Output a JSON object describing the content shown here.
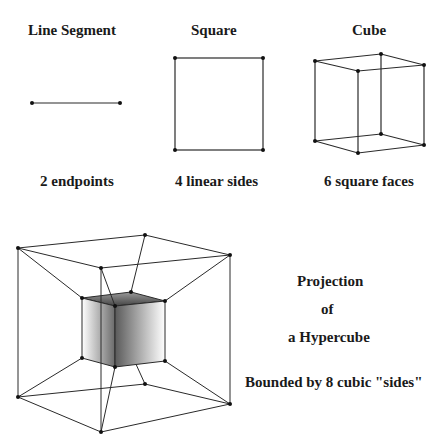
{
  "panels": [
    {
      "title": "Line Segment",
      "caption": "2 endpoints"
    },
    {
      "title": "Square",
      "caption": "4 linear sides"
    },
    {
      "title": "Cube",
      "caption": "6 square faces"
    }
  ],
  "hypercube": {
    "line1": "Projection",
    "line2": "of",
    "line3": "a Hypercube",
    "caption": "Bounded by 8 cubic \"sides\""
  },
  "colors": {
    "stroke": "#2a2a2a",
    "vertex": "#111111",
    "shade_dark": "#555555",
    "shade_light": "#ffffff"
  }
}
